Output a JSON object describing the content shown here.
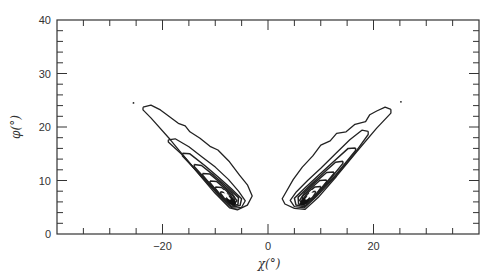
{
  "chart_data": {
    "type": "contour",
    "title": "",
    "xlabel": "χ(°)",
    "ylabel": "φ(°)",
    "xlim": [
      -40,
      40
    ],
    "ylim": [
      0,
      40
    ],
    "x_major_ticks": [
      -20,
      0,
      20
    ],
    "x_tick_labels": [
      "−20",
      "0",
      "20"
    ],
    "x_minor_step": 5,
    "y_major_ticks": [
      0,
      10,
      20,
      30,
      40
    ],
    "y_tick_labels": [
      "0",
      "10",
      "20",
      "30",
      "40"
    ],
    "y_minor_step": 2,
    "grid": false,
    "legend": null,
    "points": [
      {
        "x": -25.5,
        "y": 24.5
      },
      {
        "x": 25.2,
        "y": 24.7
      }
    ],
    "lobes": [
      {
        "name": "left",
        "peak": {
          "x": -7,
          "y": 6
        },
        "contours": [
          [
            [
              -23.7,
              23.7
            ],
            [
              -22.2,
              24.1
            ],
            [
              -20.4,
              23.2
            ],
            [
              -19.3,
              22.4
            ],
            [
              -17.0,
              20.7
            ],
            [
              -15.7,
              20.2
            ],
            [
              -14.8,
              19.1
            ],
            [
              -12.9,
              17.9
            ],
            [
              -11.0,
              16.4
            ],
            [
              -9.5,
              15.7
            ],
            [
              -7.3,
              13.5
            ],
            [
              -5.4,
              11.0
            ],
            [
              -3.9,
              9.2
            ],
            [
              -3.0,
              7.1
            ],
            [
              -3.9,
              5.4
            ],
            [
              -5.8,
              4.5
            ],
            [
              -7.3,
              4.9
            ],
            [
              -10.1,
              7.7
            ],
            [
              -13.8,
              12.0
            ],
            [
              -18.5,
              17.6
            ],
            [
              -22.2,
              21.7
            ],
            [
              -23.7,
              23.2
            ],
            [
              -23.7,
              23.7
            ]
          ],
          [
            [
              -18.9,
              17.6
            ],
            [
              -17.6,
              17.8
            ],
            [
              -15.0,
              16.3
            ],
            [
              -12.5,
              14.4
            ],
            [
              -10.0,
              12.5
            ],
            [
              -7.5,
              10.2
            ],
            [
              -5.6,
              8.0
            ],
            [
              -4.3,
              6.2
            ],
            [
              -5.0,
              5.0
            ],
            [
              -6.8,
              4.8
            ],
            [
              -9.0,
              6.9
            ],
            [
              -12.5,
              10.6
            ],
            [
              -16.0,
              14.6
            ],
            [
              -18.9,
              17.2
            ],
            [
              -18.9,
              17.6
            ]
          ],
          [
            [
              -16.2,
              15.1
            ],
            [
              -14.8,
              15.0
            ],
            [
              -12.0,
              12.8
            ],
            [
              -9.5,
              10.7
            ],
            [
              -7.0,
              8.5
            ],
            [
              -5.0,
              6.6
            ],
            [
              -5.3,
              5.3
            ],
            [
              -6.9,
              5.0
            ],
            [
              -9.2,
              7.2
            ],
            [
              -12.5,
              10.7
            ],
            [
              -16.2,
              14.6
            ],
            [
              -16.2,
              15.1
            ]
          ],
          [
            [
              -14.0,
              13.0
            ],
            [
              -12.6,
              12.8
            ],
            [
              -10.2,
              10.9
            ],
            [
              -7.6,
              8.7
            ],
            [
              -5.6,
              6.8
            ],
            [
              -5.7,
              5.5
            ],
            [
              -7.0,
              5.2
            ],
            [
              -9.0,
              7.2
            ],
            [
              -11.8,
              10.2
            ],
            [
              -14.0,
              12.6
            ],
            [
              -14.0,
              13.0
            ]
          ],
          [
            [
              -12.4,
              11.3
            ],
            [
              -11.0,
              11.2
            ],
            [
              -8.8,
              9.4
            ],
            [
              -6.8,
              7.6
            ],
            [
              -5.9,
              6.2
            ],
            [
              -6.6,
              5.4
            ],
            [
              -8.2,
              6.3
            ],
            [
              -10.5,
              8.8
            ],
            [
              -12.4,
              11.0
            ],
            [
              -12.4,
              11.3
            ]
          ],
          [
            [
              -11.0,
              9.9
            ],
            [
              -9.7,
              9.8
            ],
            [
              -8.0,
              8.4
            ],
            [
              -6.5,
              7.0
            ],
            [
              -6.3,
              6.0
            ],
            [
              -7.3,
              5.6
            ],
            [
              -9.0,
              7.2
            ],
            [
              -11.0,
              9.6
            ],
            [
              -11.0,
              9.9
            ]
          ],
          [
            [
              -10.0,
              8.8
            ],
            [
              -8.8,
              8.7
            ],
            [
              -7.3,
              7.5
            ],
            [
              -6.6,
              6.5
            ],
            [
              -7.2,
              5.9
            ],
            [
              -8.4,
              6.5
            ],
            [
              -10.0,
              8.5
            ],
            [
              -10.0,
              8.8
            ]
          ],
          [
            [
              -9.0,
              7.9
            ],
            [
              -8.0,
              7.7
            ],
            [
              -7.0,
              6.8
            ],
            [
              -7.3,
              6.2
            ],
            [
              -8.3,
              6.7
            ],
            [
              -9.0,
              7.6
            ],
            [
              -9.0,
              7.9
            ]
          ]
        ]
      },
      {
        "name": "right",
        "peak": {
          "x": 7,
          "y": 6
        },
        "contours": [
          [
            [
              23.3,
              23.3
            ],
            [
              22.2,
              23.7
            ],
            [
              20.6,
              23.0
            ],
            [
              19.3,
              22.3
            ],
            [
              18.5,
              21.0
            ],
            [
              16.5,
              20.5
            ],
            [
              14.8,
              19.1
            ],
            [
              13.0,
              18.8
            ],
            [
              11.8,
              17.4
            ],
            [
              10.0,
              16.6
            ],
            [
              8.5,
              14.6
            ],
            [
              6.5,
              12.5
            ],
            [
              4.8,
              10.2
            ],
            [
              3.5,
              8.0
            ],
            [
              2.7,
              6.6
            ],
            [
              3.2,
              5.6
            ],
            [
              5.0,
              4.8
            ],
            [
              7.0,
              4.6
            ],
            [
              9.5,
              6.8
            ],
            [
              13.0,
              10.8
            ],
            [
              17.0,
              15.6
            ],
            [
              20.6,
              19.8
            ],
            [
              23.3,
              22.6
            ],
            [
              23.3,
              23.3
            ]
          ],
          [
            [
              19.0,
              19.2
            ],
            [
              17.8,
              19.4
            ],
            [
              15.5,
              17.6
            ],
            [
              12.8,
              15.0
            ],
            [
              10.0,
              12.3
            ],
            [
              7.5,
              10.0
            ],
            [
              5.4,
              7.9
            ],
            [
              4.2,
              6.3
            ],
            [
              5.0,
              5.1
            ],
            [
              6.9,
              4.9
            ],
            [
              9.2,
              7.0
            ],
            [
              12.8,
              10.8
            ],
            [
              16.2,
              14.8
            ],
            [
              19.0,
              18.6
            ],
            [
              19.0,
              19.2
            ]
          ],
          [
            [
              16.6,
              16.1
            ],
            [
              15.2,
              16.0
            ],
            [
              12.4,
              13.5
            ],
            [
              9.6,
              11.0
            ],
            [
              7.0,
              8.6
            ],
            [
              5.0,
              6.7
            ],
            [
              5.3,
              5.4
            ],
            [
              6.9,
              5.1
            ],
            [
              9.3,
              7.4
            ],
            [
              12.8,
              11.0
            ],
            [
              16.6,
              15.6
            ],
            [
              16.6,
              16.1
            ]
          ],
          [
            [
              14.2,
              13.6
            ],
            [
              12.8,
              13.4
            ],
            [
              10.4,
              11.3
            ],
            [
              7.8,
              8.9
            ],
            [
              5.7,
              6.9
            ],
            [
              5.8,
              5.6
            ],
            [
              7.1,
              5.3
            ],
            [
              9.1,
              7.3
            ],
            [
              12.0,
              10.5
            ],
            [
              14.2,
              13.2
            ],
            [
              14.2,
              13.6
            ]
          ],
          [
            [
              12.5,
              11.6
            ],
            [
              11.1,
              11.5
            ],
            [
              8.9,
              9.6
            ],
            [
              6.9,
              7.7
            ],
            [
              6.0,
              6.3
            ],
            [
              6.7,
              5.5
            ],
            [
              8.3,
              6.4
            ],
            [
              10.6,
              9.0
            ],
            [
              12.5,
              11.3
            ],
            [
              12.5,
              11.6
            ]
          ],
          [
            [
              11.1,
              10.1
            ],
            [
              9.8,
              10.0
            ],
            [
              8.1,
              8.5
            ],
            [
              6.6,
              7.1
            ],
            [
              6.4,
              6.1
            ],
            [
              7.4,
              5.7
            ],
            [
              9.1,
              7.3
            ],
            [
              11.1,
              9.8
            ],
            [
              11.1,
              10.1
            ]
          ],
          [
            [
              10.0,
              8.9
            ],
            [
              8.9,
              8.8
            ],
            [
              7.4,
              7.6
            ],
            [
              6.7,
              6.6
            ],
            [
              7.3,
              6.0
            ],
            [
              8.5,
              6.6
            ],
            [
              10.0,
              8.6
            ],
            [
              10.0,
              8.9
            ]
          ],
          [
            [
              9.0,
              8.0
            ],
            [
              8.0,
              7.8
            ],
            [
              7.1,
              6.9
            ],
            [
              7.4,
              6.3
            ],
            [
              8.4,
              6.8
            ],
            [
              9.0,
              7.7
            ],
            [
              9.0,
              8.0
            ]
          ]
        ]
      }
    ]
  },
  "layout": {
    "frame": {
      "left": 57,
      "top": 20,
      "right": 479,
      "bottom": 234
    },
    "line_color": "#222222",
    "axis_color": "#333333"
  }
}
